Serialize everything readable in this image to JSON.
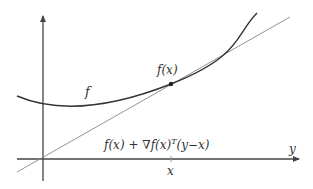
{
  "diagram": {
    "colors": {
      "background": "#ffffff",
      "axes": "#444444",
      "curve": "#333333",
      "tangent": "#888888",
      "point": "#222222",
      "text": "#333333"
    },
    "labels": {
      "curve": "f",
      "point": "f(x)",
      "tangent_prefix": "f(x) + ∇f(x)",
      "tangent_sup": "T",
      "tangent_suffix": "(y−x)",
      "x_tick": "x",
      "x_axis": "y"
    },
    "geometry": {
      "y_axis": {
        "x": 43,
        "y_top": 14,
        "y_bottom": 181
      },
      "x_axis": {
        "y": 159,
        "x_left": 17,
        "x_right": 301
      },
      "tangent_point": {
        "x": 171,
        "y": 84
      },
      "tangent_line": {
        "x1": 17,
        "y1": 172,
        "x2": 290,
        "y2": 17
      },
      "curve_path": "M 17 96 C 50 110, 100 112, 171 84 S 235 35, 257 13"
    }
  }
}
